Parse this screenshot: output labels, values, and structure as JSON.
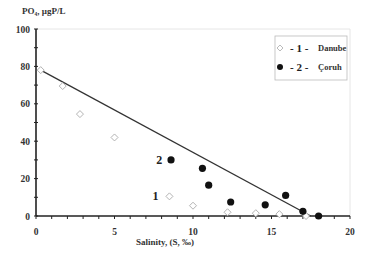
{
  "chart_data": {
    "type": "scatter",
    "title": "",
    "xlabel": "Salinity, (S, ‰)",
    "ylabel": "PO₄, µgP/L",
    "xlim": [
      0,
      20
    ],
    "ylim": [
      0,
      100
    ],
    "x_ticks": [
      "0",
      "5",
      "10",
      "15",
      "20"
    ],
    "y_ticks": [
      "0",
      "20",
      "40",
      "60",
      "80",
      "100"
    ],
    "grid": false,
    "legend_position": "upper right",
    "series": [
      {
        "name": "Danube",
        "legend_label": "- 1 -  Danube",
        "marker": "open-diamond",
        "points": [
          [
            0.3,
            78
          ],
          [
            1.7,
            69.5
          ],
          [
            2.8,
            54.5
          ],
          [
            5.0,
            42
          ],
          [
            8.5,
            10.5
          ],
          [
            10.0,
            5.5
          ],
          [
            12.2,
            2
          ],
          [
            14.0,
            1.5
          ],
          [
            15.5,
            1
          ],
          [
            17.2,
            0
          ]
        ]
      },
      {
        "name": "Coruh",
        "legend_label": "- 2 -  Çoruh",
        "marker": "filled-circle",
        "points": [
          [
            8.6,
            30
          ],
          [
            10.6,
            25.5
          ],
          [
            11.0,
            16.5
          ],
          [
            12.4,
            7.5
          ],
          [
            14.6,
            6
          ],
          [
            15.9,
            11
          ],
          [
            17.0,
            2.5
          ],
          [
            18.0,
            0
          ]
        ]
      }
    ],
    "trendline": {
      "from": [
        0.3,
        78
      ],
      "to": [
        17.5,
        0
      ]
    },
    "annotations": [
      {
        "text": "1",
        "x": 8.0,
        "y": 10.5
      },
      {
        "text": "2",
        "x": 8.1,
        "y": 30
      }
    ]
  },
  "legend": {
    "items": [
      {
        "num": "- 1 -",
        "label": "Danube"
      },
      {
        "num": "- 2 -",
        "label": "Çoruh"
      }
    ]
  },
  "axes": {
    "y_title": "PO₄, µgP/L",
    "x_title": "Salinity, (S, ‰)"
  },
  "annot": {
    "one": "1",
    "two": "2"
  }
}
